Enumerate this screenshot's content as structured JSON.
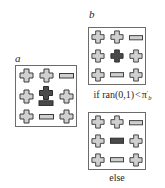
{
  "figure": {
    "type": "lattice-transition-diagram"
  },
  "glyphs": {
    "cross": "cross-glyph",
    "dash": "dash-glyph",
    "cross_highlight": "cross-highlight-glyph",
    "dash_highlight": "dash-highlight-glyph"
  },
  "colors": {
    "glyph_fill_light": "#d0d0d0",
    "glyph_fill_dark": "#4a4a4a",
    "glyph_stroke": "#3a3a3a",
    "box_border": "#6b6b6b",
    "text": "#1f1f1f",
    "background": "#ffffff"
  },
  "panels": [
    {
      "id": "panel-a",
      "label": "a",
      "caption": "",
      "grid": [
        [
          "cross",
          "cross",
          "dash"
        ],
        [
          "cross",
          "cross-dash-pair",
          "cross"
        ],
        [
          "cross",
          "dash",
          "cross"
        ]
      ]
    },
    {
      "id": "panel-b-top",
      "label": "b",
      "caption_parts": {
        "prefix": "if ran(0,1)",
        "operator": "<",
        "symbol": "π",
        "subscript": "b",
        "superscript": "′"
      },
      "caption_plain": "if ran(0,1) < πb′",
      "grid": [
        [
          "cross",
          "cross",
          "dash"
        ],
        [
          "cross",
          "cross-dark",
          "cross"
        ],
        [
          "cross",
          "dash",
          "cross"
        ]
      ]
    },
    {
      "id": "panel-b-bottom",
      "label": "",
      "caption_plain": "else",
      "grid": [
        [
          "cross",
          "cross",
          "dash"
        ],
        [
          "cross",
          "dash-dark",
          "cross"
        ],
        [
          "cross",
          "dash",
          "cross"
        ]
      ]
    }
  ]
}
